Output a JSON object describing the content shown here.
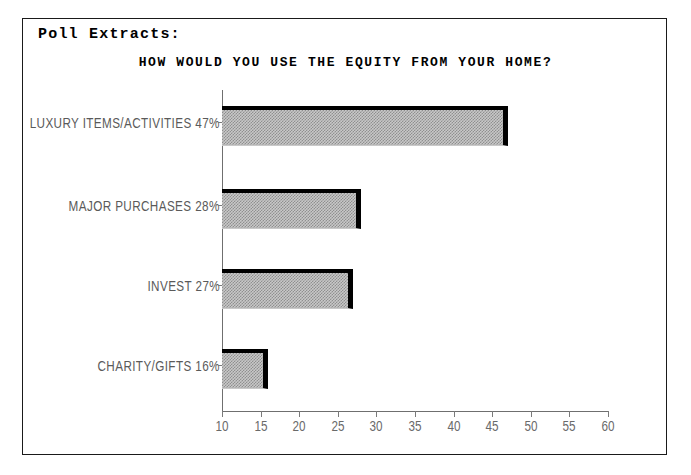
{
  "header": {
    "section_label": "Poll Extracts:"
  },
  "chart_data": {
    "type": "bar",
    "orientation": "horizontal",
    "title": "HOW WOULD YOU USE THE EQUITY FROM YOUR HOME?",
    "xlabel": "",
    "ylabel": "",
    "categories": [
      "LUXURY ITEMS/ACTIVITIES",
      "MAJOR PURCHASES",
      "INVEST",
      "CHARITY/GIFTS"
    ],
    "values": [
      47,
      28,
      27,
      16
    ],
    "value_suffix": "%",
    "labels": [
      "LUXURY ITEMS/ACTIVITIES 47%",
      "MAJOR PURCHASES 28%",
      "INVEST 27%",
      "CHARITY/GIFTS 16%"
    ],
    "xlim": [
      10,
      60
    ],
    "xticks": [
      10,
      15,
      20,
      25,
      30,
      35,
      40,
      45,
      50,
      55,
      60
    ],
    "xtick_labels": [
      "10",
      "15",
      "20",
      "25",
      "30",
      "35",
      "40",
      "45",
      "50",
      "55",
      "60"
    ],
    "grid": false,
    "legend": false,
    "bar_fill": "#c8c8c8",
    "bar_edge": "#000000",
    "axis_color": "#6f6f6f",
    "label_color": "#5a5a5a"
  }
}
